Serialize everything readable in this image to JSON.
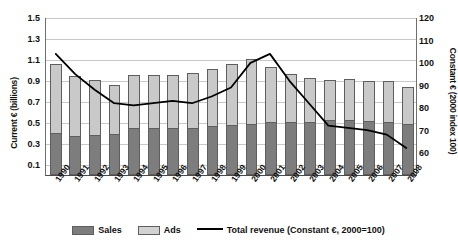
{
  "chart_data": {
    "type": "bar",
    "title": "",
    "xlabel": "",
    "ylabel": "Current € (billions)",
    "y2label": "Constant € (2000 index 100)",
    "ylim": [
      0,
      1.5
    ],
    "y2lim": [
      50,
      120
    ],
    "grid": true,
    "legend_position": "bottom",
    "categories": [
      "1990",
      "1991",
      "1992",
      "1993",
      "1994",
      "1995",
      "1996",
      "1997",
      "1998",
      "1999",
      "2000",
      "2001",
      "2002",
      "2003",
      "2004",
      "2005",
      "2006",
      "2007",
      "2008"
    ],
    "y_ticks": [
      "1.5",
      "1.3",
      "1.1",
      "0.9",
      "0.7",
      "0.5",
      "0.3",
      "0.1"
    ],
    "y_tick_values": [
      1.5,
      1.3,
      1.1,
      0.9,
      0.7,
      0.5,
      0.3,
      0.1
    ],
    "y2_ticks": [
      "120",
      "110",
      "100",
      "90",
      "80",
      "70",
      "60"
    ],
    "y2_tick_values": [
      120,
      110,
      100,
      90,
      80,
      70,
      60
    ],
    "series": [
      {
        "name": "Sales",
        "type": "bar-stack",
        "axis": "left",
        "color": "#7d7d7d",
        "values": [
          0.4,
          0.37,
          0.38,
          0.39,
          0.45,
          0.45,
          0.45,
          0.45,
          0.46,
          0.47,
          0.48,
          0.5,
          0.5,
          0.5,
          0.52,
          0.52,
          0.51,
          0.5,
          0.49
        ]
      },
      {
        "name": "Ads",
        "type": "bar-stack",
        "axis": "left",
        "color": "#c9c9c9",
        "values": [
          0.65,
          0.57,
          0.52,
          0.46,
          0.5,
          0.5,
          0.5,
          0.52,
          0.55,
          0.58,
          0.62,
          0.53,
          0.46,
          0.42,
          0.38,
          0.39,
          0.38,
          0.39,
          0.35
        ]
      },
      {
        "name": "Total",
        "type": "bar-total",
        "axis": "left",
        "values": [
          1.05,
          0.94,
          0.9,
          0.85,
          0.95,
          0.95,
          0.95,
          0.97,
          1.01,
          1.05,
          1.1,
          1.03,
          0.96,
          0.92,
          0.9,
          0.91,
          0.89,
          0.89,
          0.84
        ]
      },
      {
        "name": "Total revenue (Constant €, 2000=100)",
        "type": "line",
        "axis": "right",
        "color": "#000000",
        "values": [
          104,
          95,
          88,
          82,
          81,
          82,
          83,
          82,
          85,
          89,
          100,
          104,
          92,
          82,
          72,
          71,
          70,
          68,
          62
        ]
      }
    ],
    "legend": [
      {
        "label": "Sales",
        "marker": "swatch",
        "color": "#7d7d7d"
      },
      {
        "label": "Ads",
        "marker": "swatch",
        "color": "#c9c9c9"
      },
      {
        "label": "Total revenue (Constant €, 2000=100)",
        "marker": "line",
        "color": "#000000"
      }
    ]
  }
}
